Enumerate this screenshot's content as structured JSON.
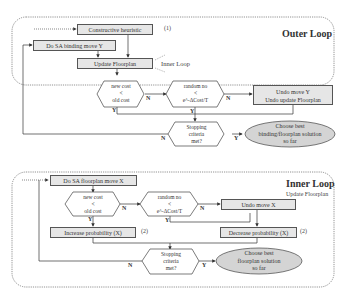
{
  "outer_loop": {
    "title": "Outer Loop",
    "inner_loop_label": "Inner Loop",
    "constructive_heuristic": "Constructive heuristic",
    "constructive_note": "(1)",
    "do_sa_binding": "Do SA binding move Y",
    "update_floorplan": "Update Floorplan",
    "cost_decision": {
      "line1": "new cost",
      "line2": "<",
      "line3": "old cost"
    },
    "random_decision": {
      "line1": "random no",
      "line2": "<",
      "line3": "e^-ΔCost/T"
    },
    "undo_box": {
      "line1": "Undo move Y",
      "line2": "Undo update Floorplan"
    },
    "stopping_decision": {
      "line1": "Stopping",
      "line2": "criteria",
      "line3": "met?"
    },
    "choose_best": {
      "line1": "Choose best",
      "line2": "binding/floorplan solution",
      "line3": "so far"
    },
    "labels": {
      "n1": "N",
      "y1": "Y",
      "n2": "N",
      "y2": "Y",
      "n3": "N",
      "y3": "Y"
    }
  },
  "inner_loop": {
    "title": "Inner Loop",
    "subtitle": "Update Floorplan",
    "do_sa_floorplan": "Do SA floorplan move X",
    "cost_decision": {
      "line1": "new cost",
      "line2": "<",
      "line3": "old cost"
    },
    "random_decision": {
      "line1": "random no",
      "line2": "<",
      "line3": "e^-ΔCost/T"
    },
    "undo_box": "Undo move X",
    "increase_prob": "Increase probability (X)",
    "increase_note": "(2)",
    "decrease_prob": "Decrease probability (X)",
    "decrease_note": "(2)",
    "stopping_decision": {
      "line1": "Stopping",
      "line2": "criteria",
      "line3": "met?"
    },
    "choose_best": {
      "line1": "Choose best",
      "line2": "floorplan solution",
      "line3": "so far"
    },
    "labels": {
      "n1": "N",
      "y1": "Y",
      "n2": "N",
      "y2": "Y",
      "n3": "N",
      "y3": "Y"
    }
  },
  "colors": {
    "box_fill": "#e6e6e6",
    "oval_fill": "#d4d4d4",
    "stroke": "#555555"
  }
}
